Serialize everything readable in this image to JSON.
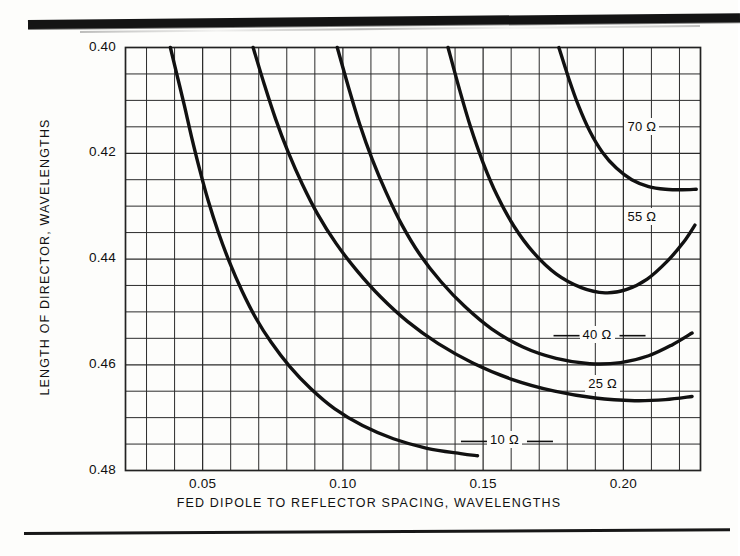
{
  "figure": {
    "background_color": "#fdfdfb",
    "ink_color": "#111111",
    "grid_color": "#2b2b2b"
  },
  "chart_data": {
    "type": "line",
    "title": "",
    "subtitle": "",
    "xlabel": "FED DIPOLE TO REFLECTOR SPACING, WAVELENGTHS",
    "ylabel": "LENGTH OF DIRECTOR, WAVELENGTHS",
    "xlim": [
      0.0225,
      0.2275
    ],
    "ylim": [
      0.4,
      0.48
    ],
    "y_inverted": true,
    "grid": true,
    "grid_x_step": 0.01,
    "grid_y_step": 0.005,
    "xticks": [
      0.05,
      0.1,
      0.15,
      0.2
    ],
    "xtick_labels": [
      "0.05",
      "0.10",
      "0.15",
      "0.20"
    ],
    "yticks": [
      0.4,
      0.42,
      0.44,
      0.46,
      0.48
    ],
    "ytick_labels": [
      "0.40",
      "0.42",
      "0.44",
      "0.46",
      "0.48"
    ],
    "legend_position": "inline-right-of-curve",
    "series": [
      {
        "name": "10 Ω",
        "label": "10 Ω",
        "label_x": 0.1585,
        "label_y": 0.4745,
        "leader_line": true,
        "points": [
          [
            0.0385,
            0.4
          ],
          [
            0.041,
            0.4055
          ],
          [
            0.0435,
            0.411
          ],
          [
            0.046,
            0.4168
          ],
          [
            0.049,
            0.4232
          ],
          [
            0.052,
            0.429
          ],
          [
            0.0555,
            0.4348
          ],
          [
            0.0595,
            0.4405
          ],
          [
            0.064,
            0.446
          ],
          [
            0.069,
            0.4512
          ],
          [
            0.0745,
            0.4558
          ],
          [
            0.081,
            0.4603
          ],
          [
            0.0885,
            0.4645
          ],
          [
            0.097,
            0.4683
          ],
          [
            0.107,
            0.4715
          ],
          [
            0.118,
            0.474
          ],
          [
            0.13,
            0.4758
          ],
          [
            0.142,
            0.4768
          ],
          [
            0.148,
            0.4772
          ]
        ]
      },
      {
        "name": "25 Ω",
        "label": "25 Ω",
        "label_x": 0.1935,
        "label_y": 0.4638,
        "leader_line": false,
        "points": [
          [
            0.068,
            0.4
          ],
          [
            0.072,
            0.407
          ],
          [
            0.076,
            0.4135
          ],
          [
            0.0805,
            0.4198
          ],
          [
            0.0855,
            0.4258
          ],
          [
            0.091,
            0.4315
          ],
          [
            0.0975,
            0.437
          ],
          [
            0.105,
            0.4422
          ],
          [
            0.1135,
            0.4472
          ],
          [
            0.123,
            0.4518
          ],
          [
            0.134,
            0.456
          ],
          [
            0.1465,
            0.4597
          ],
          [
            0.1605,
            0.4628
          ],
          [
            0.1755,
            0.465
          ],
          [
            0.19,
            0.4663
          ],
          [
            0.204,
            0.4668
          ],
          [
            0.215,
            0.4666
          ],
          [
            0.2245,
            0.466
          ]
        ]
      },
      {
        "name": "40 Ω",
        "label": "40 Ω",
        "label_x": 0.1915,
        "label_y": 0.4545,
        "leader_line": true,
        "points": [
          [
            0.098,
            0.4
          ],
          [
            0.102,
            0.4075
          ],
          [
            0.106,
            0.4145
          ],
          [
            0.1105,
            0.4212
          ],
          [
            0.1155,
            0.4275
          ],
          [
            0.121,
            0.4335
          ],
          [
            0.1275,
            0.4392
          ],
          [
            0.135,
            0.4443
          ],
          [
            0.1435,
            0.449
          ],
          [
            0.153,
            0.4532
          ],
          [
            0.164,
            0.4566
          ],
          [
            0.176,
            0.4588
          ],
          [
            0.188,
            0.4598
          ],
          [
            0.199,
            0.4596
          ],
          [
            0.209,
            0.4583
          ],
          [
            0.2175,
            0.4562
          ],
          [
            0.2245,
            0.454
          ]
        ]
      },
      {
        "name": "55 Ω",
        "label": "55 Ω",
        "label_x": 0.2075,
        "label_y": 0.4322,
        "leader_line": false,
        "points": [
          [
            0.1375,
            0.4
          ],
          [
            0.1415,
            0.4078
          ],
          [
            0.1455,
            0.415
          ],
          [
            0.15,
            0.4218
          ],
          [
            0.155,
            0.428
          ],
          [
            0.161,
            0.4338
          ],
          [
            0.168,
            0.4388
          ],
          [
            0.176,
            0.4428
          ],
          [
            0.185,
            0.4454
          ],
          [
            0.1935,
            0.4464
          ],
          [
            0.201,
            0.4458
          ],
          [
            0.2085,
            0.4438
          ],
          [
            0.2155,
            0.4405
          ],
          [
            0.2215,
            0.4368
          ],
          [
            0.2255,
            0.4336
          ]
        ]
      },
      {
        "name": "70 Ω",
        "label": "70 Ω",
        "label_x": 0.2075,
        "label_y": 0.4153,
        "leader_line": false,
        "points": [
          [
            0.177,
            0.4
          ],
          [
            0.1805,
            0.4058
          ],
          [
            0.184,
            0.411
          ],
          [
            0.188,
            0.4158
          ],
          [
            0.1925,
            0.4198
          ],
          [
            0.1975,
            0.4228
          ],
          [
            0.203,
            0.425
          ],
          [
            0.209,
            0.4263
          ],
          [
            0.215,
            0.4268
          ],
          [
            0.221,
            0.4269
          ],
          [
            0.226,
            0.4268
          ]
        ]
      }
    ]
  }
}
